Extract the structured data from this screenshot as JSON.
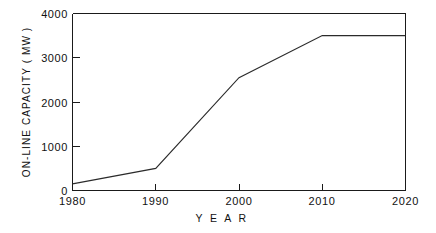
{
  "chart_data": {
    "type": "line",
    "title": "",
    "xlabel": "Y E A R",
    "ylabel": "ON-LINE  CAPACITY  ( MW )",
    "x": [
      1980,
      1990,
      2000,
      2010,
      2020
    ],
    "values": [
      150,
      500,
      2550,
      3500,
      3500
    ],
    "series": [
      {
        "name": "On-line capacity",
        "values": [
          150,
          500,
          2550,
          3500,
          3500
        ]
      }
    ],
    "categories": [
      "1980",
      "1990",
      "2000",
      "2010",
      "2020"
    ],
    "xlim": [
      1980,
      2020
    ],
    "ylim": [
      0,
      4000
    ],
    "xticks": [
      "1980",
      "1990",
      "2000",
      "2010",
      "2020"
    ],
    "yticks": [
      "0",
      "1000",
      "2000",
      "3000",
      "4000"
    ],
    "ytick_values": [
      0,
      1000,
      2000,
      3000,
      4000
    ],
    "xtick_values": [
      1980,
      1990,
      2000,
      2010,
      2020
    ],
    "grid": false,
    "legend": "none",
    "line_color": "#2b2b2b",
    "axis_color": "#1a1a1a",
    "background_color": "#ffffff"
  },
  "axes": {
    "y_title": "ON-LINE  CAPACITY  ( MW )",
    "x_title": "Y E A R",
    "y_ticks": [
      {
        "label": "4000",
        "value": 4000
      },
      {
        "label": "3000",
        "value": 3000
      },
      {
        "label": "2000",
        "value": 2000
      },
      {
        "label": "1000",
        "value": 1000
      },
      {
        "label": "0",
        "value": 0
      }
    ],
    "x_ticks": [
      {
        "label": "1980",
        "value": 1980
      },
      {
        "label": "1990",
        "value": 1990
      },
      {
        "label": "2000",
        "value": 2000
      },
      {
        "label": "2010",
        "value": 2010
      },
      {
        "label": "2020",
        "value": 2020
      }
    ]
  }
}
